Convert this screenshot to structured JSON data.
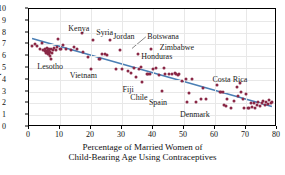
{
  "chart_data": {
    "type": "scatter",
    "title": "",
    "xlabel": "Percentage of Married Women of Child-Bearing Age Using Contraceptives",
    "xlabel_line1": "Percentage of Married Women of",
    "xlabel_line2": "Child-Bearing Age Using Contraceptives",
    "ylabel": "Births per Woman",
    "xlim": [
      0,
      80
    ],
    "ylim": [
      0,
      10
    ],
    "xticks": [
      0,
      10,
      20,
      30,
      40,
      50,
      60,
      70,
      80
    ],
    "yticks": [
      0,
      1,
      2,
      3,
      4,
      5,
      6,
      7,
      8,
      9,
      10
    ],
    "grid": true,
    "legend": "none",
    "point_color": "#8a2846",
    "line_color": "#4a7fb5",
    "trend_line": {
      "x1": 1,
      "y1": 7.45,
      "x2": 79,
      "y2": 1.6
    },
    "points": [
      [
        1.0,
        6.9
      ],
      [
        1.8,
        7.0
      ],
      [
        2.6,
        6.85
      ],
      [
        3.4,
        6.6
      ],
      [
        4.2,
        7.1
      ],
      [
        4.6,
        6.55
      ],
      [
        5.0,
        6.4
      ],
      [
        5.3,
        6.6
      ],
      [
        5.5,
        6.25
      ],
      [
        5.7,
        6.45
      ],
      [
        5.9,
        6.7
      ],
      [
        6.0,
        6.3
      ],
      [
        6.1,
        6.15
      ],
      [
        6.2,
        6.5
      ],
      [
        6.3,
        6.35
      ],
      [
        6.4,
        6.6
      ],
      [
        6.5,
        6.2
      ],
      [
        6.6,
        6.45
      ],
      [
        6.7,
        6.05
      ],
      [
        6.9,
        6.35
      ],
      [
        7.0,
        6.6
      ],
      [
        7.2,
        5.8
      ],
      [
        7.4,
        6.3
      ],
      [
        7.8,
        6.5
      ],
      [
        8.2,
        6.7
      ],
      [
        8.6,
        6.55
      ],
      [
        9.0,
        6.75
      ],
      [
        9.5,
        7.45
      ],
      [
        10.0,
        6.6
      ],
      [
        10.4,
        6.65
      ],
      [
        11.0,
        6.95
      ],
      [
        12.0,
        6.6
      ],
      [
        13.5,
        6.5
      ],
      [
        14.5,
        6.8
      ],
      [
        17.0,
        8.0
      ],
      [
        17.5,
        6.35
      ],
      [
        19.0,
        5.95
      ],
      [
        20.0,
        4.95
      ],
      [
        20.5,
        7.4
      ],
      [
        22.5,
        5.75
      ],
      [
        23.0,
        5.8
      ],
      [
        23.5,
        6.2
      ],
      [
        24.5,
        6.15
      ],
      [
        26.0,
        7.35
      ],
      [
        28.0,
        4.95
      ],
      [
        29.5,
        6.5
      ],
      [
        32.0,
        4.75
      ],
      [
        33.0,
        4.55
      ],
      [
        34.0,
        5.0
      ],
      [
        34.5,
        4.2
      ],
      [
        35.0,
        6.15
      ],
      [
        35.5,
        4.95
      ],
      [
        36.0,
        5.1
      ],
      [
        36.5,
        3.85
      ],
      [
        38.0,
        4.45
      ],
      [
        38.5,
        4.5
      ],
      [
        39.0,
        4.5
      ],
      [
        39.5,
        6.6
      ],
      [
        40.0,
        4.95
      ],
      [
        41.0,
        5.0
      ],
      [
        42.0,
        4.4
      ],
      [
        43.0,
        3.05
      ],
      [
        43.5,
        5.0
      ],
      [
        44.0,
        4.45
      ],
      [
        46.0,
        4.5
      ],
      [
        47.0,
        4.55
      ],
      [
        47.5,
        4.45
      ],
      [
        48.0,
        4.4
      ],
      [
        48.5,
        4.45
      ],
      [
        49.5,
        3.9
      ],
      [
        50.5,
        4.05
      ],
      [
        51.0,
        2.1
      ],
      [
        51.5,
        2.85
      ],
      [
        52.5,
        4.1
      ],
      [
        54.0,
        2.15
      ],
      [
        55.5,
        2.4
      ],
      [
        56.0,
        3.3
      ],
      [
        57.0,
        2.4
      ],
      [
        60.5,
        3.6
      ],
      [
        61.5,
        2.95
      ],
      [
        62.5,
        3.0
      ],
      [
        63.0,
        1.9
      ],
      [
        63.5,
        1.75
      ],
      [
        64.0,
        2.35
      ],
      [
        65.0,
        1.65
      ],
      [
        66.0,
        2.2
      ],
      [
        67.0,
        3.4
      ],
      [
        67.5,
        2.6
      ],
      [
        68.0,
        3.7
      ],
      [
        68.5,
        2.95
      ],
      [
        69.0,
        2.4
      ],
      [
        69.5,
        1.6
      ],
      [
        70.0,
        2.8
      ],
      [
        70.5,
        1.6
      ],
      [
        71.0,
        1.65
      ],
      [
        71.5,
        2.0
      ],
      [
        72.0,
        1.7
      ],
      [
        72.5,
        2.05
      ],
      [
        73.0,
        1.65
      ],
      [
        73.5,
        1.9
      ],
      [
        74.0,
        2.15
      ],
      [
        74.5,
        1.75
      ],
      [
        75.0,
        2.0
      ],
      [
        75.5,
        2.2
      ],
      [
        76.0,
        1.85
      ],
      [
        76.5,
        2.1
      ],
      [
        77.0,
        1.95
      ],
      [
        77.5,
        2.25
      ],
      [
        78.0,
        2.0
      ],
      [
        78.5,
        2.1
      ],
      [
        62.0,
        3.0
      ],
      [
        45.0,
        4.45
      ],
      [
        30.0,
        4.9
      ],
      [
        25.0,
        6.1
      ],
      [
        15.5,
        6.6
      ]
    ],
    "annotations": [
      {
        "name": "Kenya",
        "x": 13.0,
        "y": 8.55,
        "align": "left"
      },
      {
        "name": "Syria",
        "x": 22.0,
        "y": 8.25,
        "align": "left"
      },
      {
        "name": "Jordan",
        "x": 27.5,
        "y": 7.85,
        "align": "left"
      },
      {
        "name": "Botswana",
        "x": 38.5,
        "y": 7.85,
        "align": "left"
      },
      {
        "name": "Zimbabwe",
        "x": 42.5,
        "y": 6.95,
        "align": "left"
      },
      {
        "name": "Honduras",
        "x": 36.5,
        "y": 6.15,
        "align": "left"
      },
      {
        "name": "Lesotho",
        "x": 3.0,
        "y": 5.35,
        "align": "left"
      },
      {
        "name": "Vietnam",
        "x": 13.5,
        "y": 4.55,
        "align": "left"
      },
      {
        "name": "Fiji",
        "x": 30.5,
        "y": 3.35,
        "align": "left"
      },
      {
        "name": "Chile",
        "x": 33.0,
        "y": 2.75,
        "align": "left"
      },
      {
        "name": "Spain",
        "x": 39.0,
        "y": 2.25,
        "align": "left"
      },
      {
        "name": "Denmark",
        "x": 49.0,
        "y": 1.3,
        "align": "left"
      },
      {
        "name": "Costa Rica",
        "x": 59.5,
        "y": 4.25,
        "align": "left"
      }
    ],
    "leader_lines": [
      {
        "from_x": 38.0,
        "from_y": 7.6,
        "to_x": 33.5,
        "to_y": 6.6
      }
    ]
  }
}
